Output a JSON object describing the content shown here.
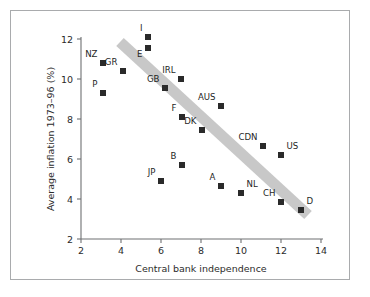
{
  "chart_data": {
    "type": "scatter",
    "title": "",
    "xlabel": "Central bank independence",
    "ylabel": "Average inflation 1973–96 (%)",
    "xlim": [
      2,
      14
    ],
    "ylim": [
      2,
      12
    ],
    "xticks": [
      "2",
      "4",
      "6",
      "8",
      "10",
      "12",
      "14"
    ],
    "yticks": [
      "2",
      "4",
      "6",
      "8",
      "10",
      "12"
    ],
    "xtick_values": [
      2,
      4,
      6,
      8,
      10,
      12,
      14
    ],
    "ytick_values": [
      2,
      4,
      6,
      8,
      10,
      12
    ],
    "grid": false,
    "legend": "none",
    "marker_color": "#2a2a2a",
    "trend_band_color": "#c8c8c8",
    "frame_color": "#a9abad",
    "annotations": [
      {
        "label": "NZ",
        "x": 3.1,
        "y": 10.8,
        "label_pos": "upper-left"
      },
      {
        "label": "P",
        "x": 3.1,
        "y": 9.3,
        "label_pos": "upper-left"
      },
      {
        "label": "GR",
        "x": 4.1,
        "y": 10.4,
        "label_pos": "upper-left"
      },
      {
        "label": "I",
        "x": 5.35,
        "y": 12.1,
        "label_pos": "upper-left"
      },
      {
        "label": "E",
        "x": 5.35,
        "y": 11.55,
        "label_pos": "lower-left"
      },
      {
        "label": "GB",
        "x": 6.2,
        "y": 9.55,
        "label_pos": "upper-left"
      },
      {
        "label": "JP",
        "x": 6.0,
        "y": 4.9,
        "label_pos": "upper-left"
      },
      {
        "label": "IRL",
        "x": 7.0,
        "y": 10.0,
        "label_pos": "upper-left"
      },
      {
        "label": "F",
        "x": 7.05,
        "y": 8.1,
        "label_pos": "upper-left"
      },
      {
        "label": "B",
        "x": 7.05,
        "y": 5.7,
        "label_pos": "upper-left"
      },
      {
        "label": "DK",
        "x": 8.05,
        "y": 7.45,
        "label_pos": "upper-left"
      },
      {
        "label": "AUS",
        "x": 9.0,
        "y": 8.65,
        "label_pos": "upper-left"
      },
      {
        "label": "A",
        "x": 9.0,
        "y": 4.65,
        "label_pos": "upper-left"
      },
      {
        "label": "NL",
        "x": 10.0,
        "y": 4.3,
        "label_pos": "upper-right"
      },
      {
        "label": "CDN",
        "x": 11.1,
        "y": 6.65,
        "label_pos": "upper-left"
      },
      {
        "label": "US",
        "x": 12.0,
        "y": 6.2,
        "label_pos": "upper-right"
      },
      {
        "label": "CH",
        "x": 12.0,
        "y": 3.85,
        "label_pos": "upper-left"
      },
      {
        "label": "D",
        "x": 13.0,
        "y": 3.45,
        "label_pos": "upper-right"
      }
    ],
    "series": [
      {
        "name": "countries",
        "points": [
          {
            "label": "NZ",
            "x": 3.1,
            "y": 10.8
          },
          {
            "label": "P",
            "x": 3.1,
            "y": 9.3
          },
          {
            "label": "GR",
            "x": 4.1,
            "y": 10.4
          },
          {
            "label": "I",
            "x": 5.35,
            "y": 12.1
          },
          {
            "label": "E",
            "x": 5.35,
            "y": 11.55
          },
          {
            "label": "GB",
            "x": 6.2,
            "y": 9.55
          },
          {
            "label": "JP",
            "x": 6.0,
            "y": 4.9
          },
          {
            "label": "IRL",
            "x": 7.0,
            "y": 10.0
          },
          {
            "label": "F",
            "x": 7.05,
            "y": 8.1
          },
          {
            "label": "B",
            "x": 7.05,
            "y": 5.7
          },
          {
            "label": "DK",
            "x": 8.05,
            "y": 7.45
          },
          {
            "label": "AUS",
            "x": 9.0,
            "y": 8.65
          },
          {
            "label": "A",
            "x": 9.0,
            "y": 4.65
          },
          {
            "label": "NL",
            "x": 10.0,
            "y": 4.3
          },
          {
            "label": "CDN",
            "x": 11.1,
            "y": 6.65
          },
          {
            "label": "US",
            "x": 12.0,
            "y": 6.2
          },
          {
            "label": "CH",
            "x": 12.0,
            "y": 3.85
          },
          {
            "label": "D",
            "x": 13.0,
            "y": 3.45
          }
        ]
      }
    ],
    "trend_band": {
      "x_start": 3.95,
      "y_start": 11.85,
      "x_end": 13.35,
      "y_end": 3.2,
      "width_px": 11
    }
  }
}
